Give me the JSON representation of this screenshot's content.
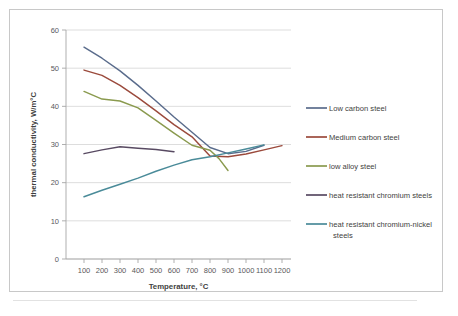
{
  "chart_data": {
    "type": "line",
    "title": "",
    "xlabel": "Temperature, °C",
    "ylabel": "thermal conductivity, W/m°C",
    "xlim": [
      0,
      1250
    ],
    "ylim": [
      0,
      60
    ],
    "xticks": [
      100,
      200,
      300,
      400,
      500,
      600,
      700,
      800,
      900,
      1000,
      1100,
      1200
    ],
    "yticks": [
      0,
      10,
      20,
      30,
      40,
      50,
      60
    ],
    "grid": "horizontal",
    "legend_position": "right",
    "series": [
      {
        "name": "Low carbon steel",
        "color": "#5a6c8c",
        "x": [
          100,
          200,
          300,
          400,
          500,
          600,
          700,
          800,
          900,
          1000,
          1100
        ],
        "y": [
          55.5,
          52.6,
          49.3,
          45.5,
          41.4,
          37.2,
          33.2,
          29.2,
          27.6,
          28.2,
          29.8
        ]
      },
      {
        "name": "Medium carbon steel",
        "color": "#9b4a3c",
        "x": [
          100,
          200,
          300,
          400,
          500,
          600,
          700,
          800,
          900,
          1000,
          1100,
          1200
        ],
        "y": [
          49.5,
          48.1,
          45.5,
          42.3,
          38.8,
          35.2,
          32.0,
          27.0,
          26.8,
          27.5,
          28.6,
          29.7
        ]
      },
      {
        "name": "low alloy steel",
        "color": "#8a9a4e",
        "x": [
          100,
          200,
          300,
          400,
          500,
          600,
          700,
          800,
          850,
          900
        ],
        "y": [
          43.9,
          41.9,
          41.4,
          39.6,
          36.3,
          33.0,
          29.8,
          28.5,
          26.3,
          23.2
        ]
      },
      {
        "name": "heat resistant chromium steels",
        "color": "#584a62",
        "x": [
          100,
          200,
          300,
          400,
          500,
          600
        ],
        "y": [
          27.6,
          28.6,
          29.4,
          29.0,
          28.7,
          28.1
        ]
      },
      {
        "name": "heat resistant chromium-nickel steels",
        "color": "#4a8b99",
        "x": [
          100,
          200,
          300,
          400,
          500,
          600,
          700,
          800,
          900,
          1000,
          1100
        ],
        "y": [
          16.3,
          18.0,
          19.6,
          21.2,
          23.0,
          24.6,
          26.0,
          26.8,
          27.8,
          28.8,
          29.9
        ]
      }
    ]
  },
  "axes": {
    "x_title": "Temperature, °C",
    "y_title": "thermal conductivity, W/m°C",
    "x_tick_labels": [
      "100",
      "200",
      "300",
      "400",
      "500",
      "600",
      "700",
      "800",
      "900",
      "1000",
      "1100",
      "1200"
    ],
    "y_tick_labels": [
      "0",
      "10",
      "20",
      "30",
      "40",
      "50",
      "60"
    ]
  },
  "legend": {
    "items": [
      {
        "label": "Low carbon steel",
        "color": "#5a6c8c"
      },
      {
        "label": "Medium carbon steel",
        "color": "#9b4a3c"
      },
      {
        "label": "low alloy steel",
        "color": "#8a9a4e"
      },
      {
        "label": "heat resistant chromium steels",
        "color": "#584a62"
      },
      {
        "label": "heat resistant chromium-nickel",
        "color": "#4a8b99"
      },
      {
        "label": "steels",
        "color": ""
      }
    ]
  }
}
